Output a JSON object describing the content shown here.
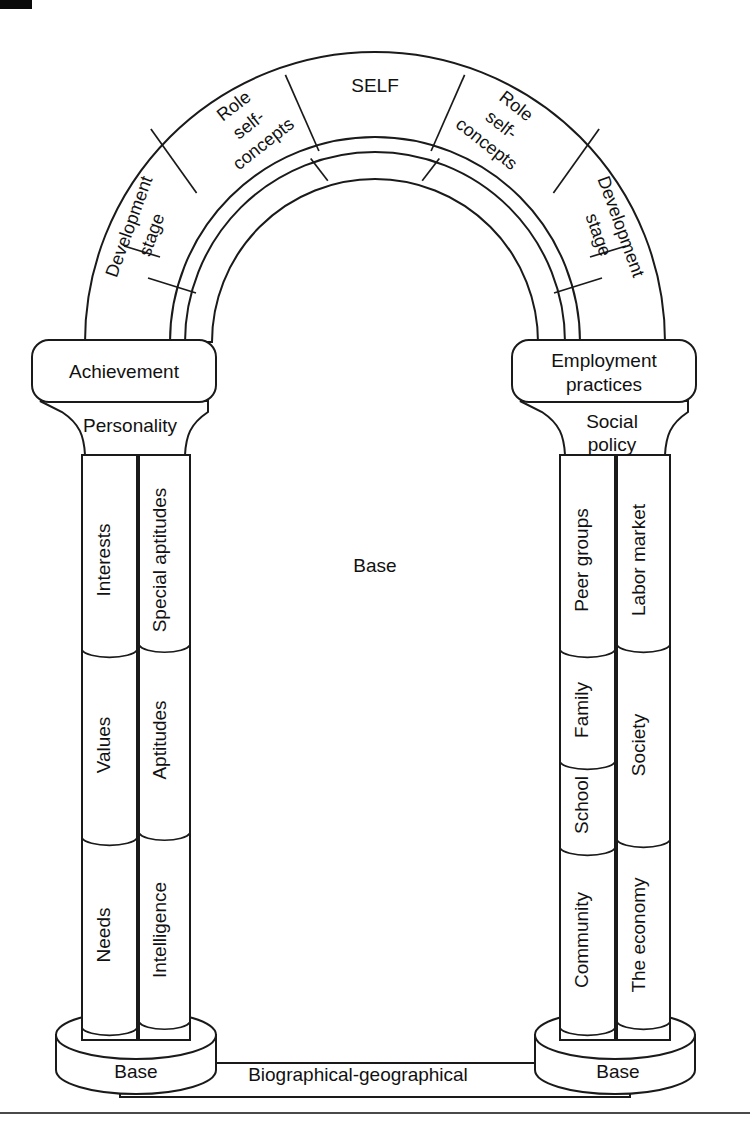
{
  "figure": {
    "title_text": "",
    "colors": {
      "stroke": "#1a1a1a",
      "text": "#111111",
      "background": "#ffffff"
    }
  },
  "arch": {
    "keystone": {
      "label": "SELF"
    },
    "voussoirs_left": [
      {
        "label_line1": "Role",
        "label_line2": "self-",
        "label_line3": "concepts"
      },
      {
        "label_line1": "Development",
        "label_line2": "stage"
      }
    ],
    "voussoirs_right": [
      {
        "label_line1": "Role",
        "label_line2": "self-",
        "label_line3": "concepts"
      },
      {
        "label_line1": "Development",
        "label_line2": "stage"
      }
    ],
    "inner_band_label": ""
  },
  "center": {
    "label": "Base"
  },
  "left_column": {
    "capital": {
      "label": "Achievement"
    },
    "abacus": {
      "label": "Personality"
    },
    "inner_shaft": {
      "segments": [
        "Interests",
        "Values",
        "Needs"
      ]
    },
    "outer_shaft": {
      "segments": [
        "Special aptitudes",
        "Aptitudes",
        "Intelligence"
      ]
    },
    "base": {
      "label": "Base"
    }
  },
  "right_column": {
    "capital": {
      "label_line1": "Employment",
      "label_line2": "practices"
    },
    "abacus": {
      "label_line1": "Social",
      "label_line2": "policy"
    },
    "inner_shaft": {
      "segments": [
        "Peer groups",
        "Family",
        "School",
        "Community"
      ]
    },
    "outer_shaft": {
      "segments": [
        "Labor market",
        "Society",
        "The economy"
      ]
    },
    "base": {
      "label": "Base"
    }
  },
  "ground": {
    "label": "Biographical-geographical"
  }
}
